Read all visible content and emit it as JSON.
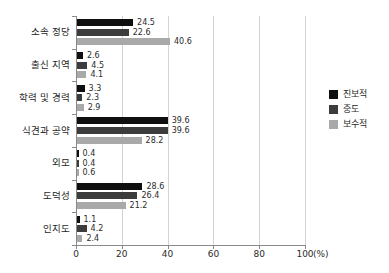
{
  "chart_data": {
    "type": "bar",
    "orientation": "horizontal",
    "title": "",
    "subtitle": "",
    "xlabel": "(%)",
    "ylabel": "",
    "xlim": [
      0,
      100
    ],
    "xticks": [
      0,
      20,
      40,
      60,
      80,
      100
    ],
    "xtick_labels": [
      "0",
      "20",
      "40",
      "60",
      "80",
      "100"
    ],
    "unit_label": "(%)",
    "grid": true,
    "grid_axis": "x",
    "legend_position": "right",
    "categories": [
      "소속 정당",
      "출신 지역",
      "학력 및 경력",
      "식견과 공약",
      "외모",
      "도덕성",
      "인지도"
    ],
    "series": [
      {
        "name": "진보적",
        "color": "#0f0f0f",
        "values": [
          24.5,
          2.6,
          3.3,
          39.6,
          0.4,
          28.6,
          1.1
        ],
        "value_labels": [
          "24.5",
          "2.6",
          "3.3",
          "39.6",
          "0.4",
          "28.6",
          "1.1"
        ]
      },
      {
        "name": "중도",
        "color": "#3c3c3c",
        "values": [
          22.6,
          4.5,
          2.3,
          39.6,
          0.4,
          26.4,
          4.2
        ],
        "value_labels": [
          "22.6",
          "4.5",
          "2.3",
          "39.6",
          "0.4",
          "26.4",
          "4.2"
        ]
      },
      {
        "name": "보수적",
        "color": "#a9a9a9",
        "values": [
          40.6,
          4.1,
          2.9,
          28.2,
          0.6,
          21.2,
          2.4
        ],
        "value_labels": [
          "40.6",
          "4.1",
          "2.9",
          "28.2",
          "0.6",
          "21.2",
          "2.4"
        ]
      }
    ]
  },
  "legend": {
    "items": [
      {
        "label": "진보적",
        "color": "#0f0f0f"
      },
      {
        "label": "중도",
        "color": "#3c3c3c"
      },
      {
        "label": "보수적",
        "color": "#a9a9a9"
      }
    ]
  },
  "axis": {
    "unit": "(%)"
  }
}
